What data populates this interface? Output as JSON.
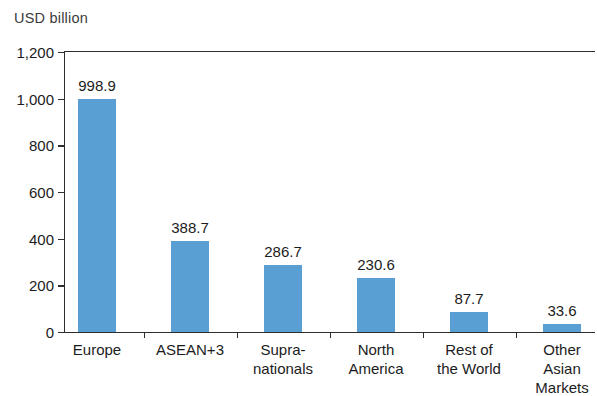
{
  "chart_data": {
    "type": "bar",
    "title": "",
    "subtitle": "",
    "xlabel": "",
    "ylabel": "USD billion",
    "ylim": [
      0,
      1200
    ],
    "ytick_labels": [
      "1,200",
      "1,000",
      "800",
      "600",
      "400",
      "200",
      "0"
    ],
    "ytick_values": [
      1200,
      1000,
      800,
      600,
      400,
      200,
      0
    ],
    "grid": false,
    "legend": null,
    "bar_color": "#5a9fd4",
    "categories": [
      "Europe",
      "ASEAN+3",
      "Supra-\nnationals",
      "North\nAmerica",
      "Rest of\nthe World",
      "Other\nAsian\nMarkets"
    ],
    "values": [
      998.9,
      388.7,
      286.7,
      230.6,
      87.7,
      33.6
    ],
    "value_labels": [
      "998.9",
      "388.7",
      "286.7",
      "230.6",
      "87.7",
      "33.6"
    ]
  },
  "axis": {
    "unit_label": "USD billion"
  }
}
